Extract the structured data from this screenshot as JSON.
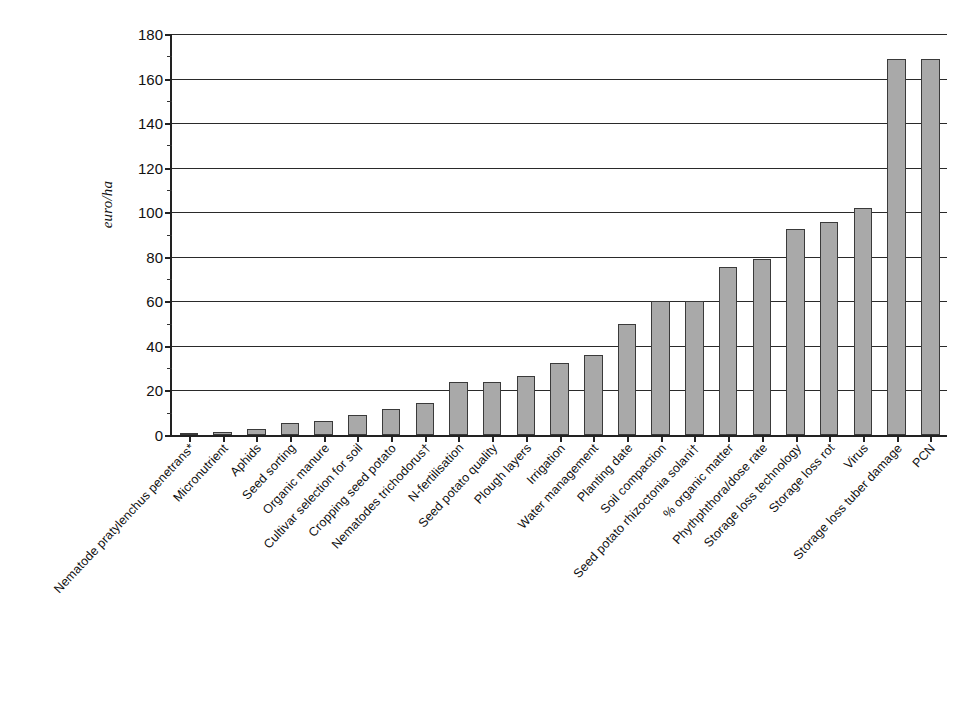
{
  "chart_data": {
    "type": "bar",
    "title": "",
    "xlabel": "",
    "ylabel": "euro/ha",
    "ylim": [
      0,
      180
    ],
    "ytick_step": 20,
    "yticks": [
      0,
      20,
      40,
      60,
      80,
      100,
      120,
      140,
      160,
      180
    ],
    "ytick_labels": [
      "0",
      "20",
      "40",
      "60",
      "80",
      "100",
      "120",
      "140",
      "160",
      "180"
    ],
    "grid": true,
    "legend": "none",
    "bar_color": "#a9a9a9",
    "bar_edge_color": "#3a3a3a",
    "axis_color": "#222222",
    "categories": [
      "Nematode pratylenchus penetrans*",
      "Micronutrient",
      "Aphids",
      "Seed sorting",
      "Organic manure",
      "Cultivar selection for soil",
      "Cropping seed potato",
      "Nematodes trichodorus†",
      "N-fertilisation",
      "Seed potato quality",
      "Plough layers",
      "Irrigation",
      "Water management",
      "Planting date",
      "Soil compaction",
      "Seed potato rhizoctonia solani†",
      "% organic matter",
      "Phythphthora/dose rate",
      "Storage loss technology",
      "Storage loss rot",
      "Virus",
      "Storage loss tuber damage",
      "PCN"
    ],
    "values": [
      0.7,
      1.5,
      2.8,
      5.5,
      6.5,
      9.0,
      11.5,
      14.5,
      24.0,
      24.0,
      26.5,
      32.5,
      36.0,
      50.0,
      60.0,
      60.0,
      75.5,
      79.0,
      92.5,
      95.5,
      102.0,
      169.0,
      169.0
    ]
  },
  "figure": {
    "background": "#ffffff"
  }
}
